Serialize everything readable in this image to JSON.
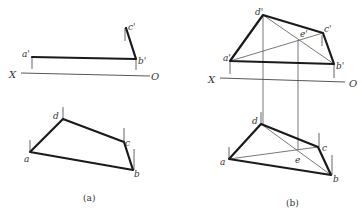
{
  "figure": {
    "panel_a": {
      "caption": "(a)",
      "axis": {
        "x_label": "X",
        "o_label": "O"
      },
      "front_view": {
        "labels": {
          "a": "a'",
          "b": "b'",
          "c": "c'"
        }
      },
      "top_view": {
        "labels": {
          "a": "a",
          "b": "b",
          "c": "c",
          "d": "d"
        }
      }
    },
    "panel_b": {
      "caption": "(b)",
      "axis": {
        "x_label": "X",
        "o_label": "O"
      },
      "front_view": {
        "labels": {
          "a": "a'",
          "b": "b'",
          "c": "c'",
          "d": "d'",
          "e": "e'"
        }
      },
      "top_view": {
        "labels": {
          "a": "a",
          "b": "b",
          "c": "c",
          "d": "d",
          "e": "e"
        }
      }
    }
  },
  "colors": {
    "line": "#1a1a1a",
    "thin_line": "#555555",
    "background": "#ffffff"
  }
}
